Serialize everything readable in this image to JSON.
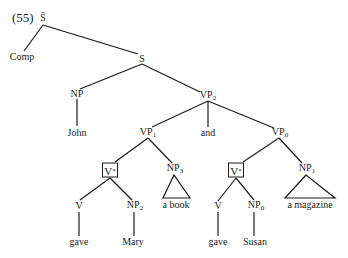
{
  "example_number": "(55)",
  "tree": {
    "root": {
      "label": "S̄"
    },
    "comp": {
      "label": "Comp"
    },
    "s": {
      "label": "S"
    },
    "np_subject": {
      "label": "NP",
      "word": "John"
    },
    "vp2": {
      "label": "VP",
      "sub": "2"
    },
    "vp1": {
      "label": "VP",
      "sub": "1"
    },
    "conj": {
      "label": "and"
    },
    "vp0": {
      "label": "VP",
      "sub": "0"
    },
    "left": {
      "vstar": {
        "label": "V",
        "sub": "*"
      },
      "v": {
        "label": "V",
        "word": "gave"
      },
      "np2": {
        "label": "NP",
        "sub": "2",
        "word": "Mary"
      },
      "np3": {
        "label": "NP",
        "sub": "3",
        "word": "a book"
      }
    },
    "right": {
      "vstar": {
        "label": "V",
        "sub": "*"
      },
      "v": {
        "label": "V",
        "word": "gave"
      },
      "np0": {
        "label": "NP",
        "sub": "0",
        "word": "Susan"
      },
      "np1": {
        "label": "NP",
        "sub": "1",
        "word": "a magazine"
      }
    }
  }
}
